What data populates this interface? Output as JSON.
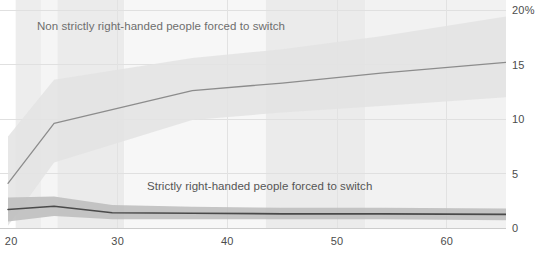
{
  "chart_data": {
    "type": "line",
    "title": "",
    "subtitle": "",
    "xlabel": "",
    "ylabel": "",
    "xlim": [
      20,
      65.4
    ],
    "ylim": [
      0,
      20
    ],
    "grid": true,
    "legend_position": "inline-annotation",
    "x_ticks": [
      20,
      30,
      40,
      50,
      60
    ],
    "x_tick_labels": [
      "20",
      "30",
      "40",
      "50",
      "60"
    ],
    "y_ticks": [
      0,
      5,
      10,
      15,
      20
    ],
    "y_tick_labels": [
      "0",
      "5",
      "10",
      "15",
      "20%"
    ],
    "series": [
      {
        "name": "Non strictly right-handed people forced to switch",
        "color": "#8c8c8c",
        "band_color": "#e3e3e3",
        "x": [
          20,
          24.2,
          36.8,
          45.0,
          54.0,
          65.4
        ],
        "values": [
          4.1,
          9.6,
          12.6,
          13.3,
          14.2,
          15.2
        ],
        "band_low": [
          0.2,
          6.0,
          9.9,
          10.6,
          11.2,
          12.0
        ],
        "band_high": [
          8.4,
          13.6,
          15.6,
          16.4,
          17.6,
          19.4
        ]
      },
      {
        "name": "Strictly right-handed people forced to switch",
        "color": "#4a4a4a",
        "band_color": "#bfbfbf",
        "x": [
          20,
          24.2,
          29.5,
          36.8,
          45.0,
          54.0,
          65.4
        ],
        "values": [
          1.7,
          2.0,
          1.4,
          1.35,
          1.3,
          1.3,
          1.25
        ],
        "band_low": [
          0.6,
          1.1,
          0.8,
          0.8,
          0.8,
          0.8,
          0.7
        ],
        "band_high": [
          2.8,
          2.9,
          2.1,
          1.95,
          1.85,
          1.85,
          1.8
        ]
      }
    ],
    "annotations": [
      {
        "id": "upper",
        "text": "Non strictly right-handed people forced to switch"
      },
      {
        "id": "lower",
        "text": "Strictly right-handed people forced to switch"
      }
    ],
    "background_bands": [
      {
        "x0": 20.7,
        "x1": 23.0,
        "shade": "#ededed"
      },
      {
        "x0": 23.0,
        "x1": 24.5,
        "shade": "#f5f5f5"
      },
      {
        "x0": 24.5,
        "x1": 30.6,
        "shade": "#ebebeb"
      },
      {
        "x0": 30.6,
        "x1": 43.5,
        "shade": "#f7f7f7"
      },
      {
        "x0": 43.5,
        "x1": 52.6,
        "shade": "#ebebeb"
      },
      {
        "x0": 52.6,
        "x1": 65.4,
        "shade": "#f2f2f2"
      }
    ]
  },
  "axes": {
    "y": {
      "ticks": [
        {
          "label": "20%",
          "value": 20
        },
        {
          "label": "15",
          "value": 15
        },
        {
          "label": "10",
          "value": 10
        },
        {
          "label": "5",
          "value": 5
        },
        {
          "label": "0",
          "value": 0
        }
      ]
    },
    "x": {
      "ticks": [
        {
          "label": "20",
          "value": 20
        },
        {
          "label": "30",
          "value": 30
        },
        {
          "label": "40",
          "value": 40
        },
        {
          "label": "50",
          "value": 50
        },
        {
          "label": "60",
          "value": 60
        }
      ]
    }
  },
  "clipped_header": {
    "text": ""
  }
}
